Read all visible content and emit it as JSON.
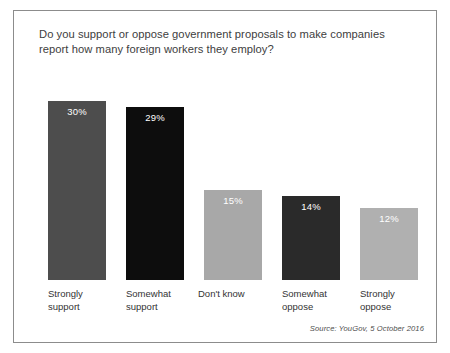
{
  "chart_data": {
    "type": "bar",
    "title": "Do you support or oppose government proposals to make companies report how many foreign workers they employ?",
    "categories": [
      "Strongly support",
      "Somewhat support",
      "Don't know",
      "Somewhat oppose",
      "Strongly oppose"
    ],
    "category_lines": [
      [
        "Strongly",
        "support"
      ],
      [
        "Somewhat",
        "support"
      ],
      [
        "Don't know",
        ""
      ],
      [
        "Somewhat",
        "oppose"
      ],
      [
        "Strongly",
        "oppose"
      ]
    ],
    "values": [
      30,
      29,
      15,
      14,
      12
    ],
    "value_labels": [
      "30%",
      "29%",
      "15%",
      "14%",
      "12%"
    ],
    "colors": [
      "#4d4d4d",
      "#0d0d0d",
      "#a8a8a8",
      "#2a2a2a",
      "#b0b0b0"
    ],
    "xlabel": "",
    "ylabel": "",
    "ylim": [
      0,
      30
    ],
    "grid": false,
    "legend": "none",
    "annotation": "Source: YouGov, 5 October 2016"
  },
  "figure": {
    "title": "Do you support or oppose government proposals to make companies report how many foreign workers they employ?",
    "source": "Source: YouGov, 5 October 2016"
  },
  "bars": [
    {
      "label_line1": "Strongly",
      "label_line2": "support",
      "value_label": "30%"
    },
    {
      "label_line1": "Somewhat",
      "label_line2": "support",
      "value_label": "29%"
    },
    {
      "label_line1": "Don't know",
      "label_line2": "",
      "value_label": "15%"
    },
    {
      "label_line1": "Somewhat",
      "label_line2": "oppose",
      "value_label": "14%"
    },
    {
      "label_line1": "Strongly",
      "label_line2": "oppose",
      "value_label": "12%"
    }
  ]
}
